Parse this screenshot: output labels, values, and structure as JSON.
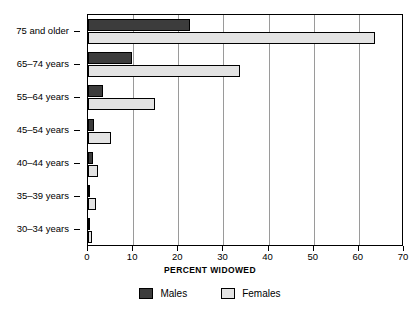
{
  "chart_data": {
    "type": "bar",
    "orientation": "horizontal",
    "title": "",
    "xlabel": "PERCENT WIDOWED",
    "ylabel": "",
    "xlim": [
      0,
      70
    ],
    "xticks": [
      0,
      10,
      20,
      30,
      40,
      50,
      60,
      70
    ],
    "xtick_labels": [
      "0",
      "10",
      "20",
      "30",
      "40",
      "50",
      "60",
      "70"
    ],
    "grid": "vertical",
    "legend_position": "bottom-center",
    "categories": [
      "75 and older",
      "65–74 years",
      "55–64 years",
      "45–54 years",
      "40–44 years",
      "35–39 years",
      "30–34 years"
    ],
    "series": [
      {
        "name": "Males",
        "color": "#3c3c3c",
        "values": [
          22.7,
          9.7,
          3.4,
          1.3,
          1.0,
          0.4,
          0.4
        ]
      },
      {
        "name": "Females",
        "color": "#e3e3e3",
        "values": [
          63.6,
          33.7,
          14.9,
          5.1,
          2.3,
          1.8,
          0.9
        ]
      }
    ]
  },
  "legend": {
    "items": [
      {
        "label": "Males",
        "swatch": "males"
      },
      {
        "label": "Females",
        "swatch": "females"
      }
    ]
  },
  "axis": {
    "x_title": "PERCENT WIDOWED"
  },
  "colors": {
    "males": "#3c3c3c",
    "females": "#e3e3e3",
    "outline": "#000000",
    "gridline": "#9a9a9a",
    "background": "#ffffff"
  }
}
